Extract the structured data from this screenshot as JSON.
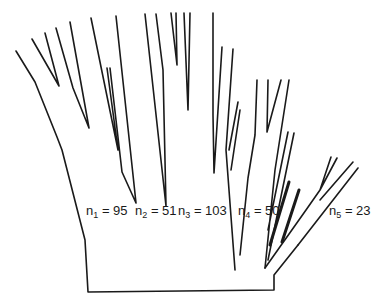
{
  "diagram": {
    "type": "branching-tree",
    "line_color": "#1a1a1a",
    "background": "#ffffff",
    "clades": [
      {
        "id": "n1",
        "sym": "n",
        "sub": "1",
        "eq": "= 95",
        "value": 95
      },
      {
        "id": "n2",
        "sym": "n",
        "sub": "2",
        "eq": "= 51",
        "value": 51
      },
      {
        "id": "n3",
        "sym": "n",
        "sub": "3",
        "eq": "= 103",
        "value": 103
      },
      {
        "id": "n4",
        "sym": "n",
        "sub": "4",
        "eq": "= 50",
        "value": 50
      },
      {
        "id": "n5",
        "sym": "n",
        "sub": "5",
        "eq": "= 23",
        "value": 23
      }
    ]
  }
}
